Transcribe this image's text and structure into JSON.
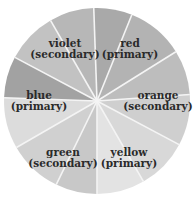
{
  "diagram": {
    "center": [
      97,
      101
    ],
    "radius": 93,
    "divider_color": "#f4f4f4",
    "segments": [
      {
        "start": -2,
        "end": 22,
        "fill": "#a9a9a9"
      },
      {
        "start": 22,
        "end": 58,
        "fill": "#b3b3b3"
      },
      {
        "start": 58,
        "end": 86,
        "fill": "#bdbdbd"
      },
      {
        "start": 86,
        "end": 118,
        "fill": "#cfcfcf"
      },
      {
        "start": 118,
        "end": 150,
        "fill": "#d8d8d8"
      },
      {
        "start": 150,
        "end": 180,
        "fill": "#e3e3e3"
      },
      {
        "start": 180,
        "end": 206,
        "fill": "#c8c8c8"
      },
      {
        "start": 206,
        "end": 240,
        "fill": "#d0d0d0"
      },
      {
        "start": 240,
        "end": 272,
        "fill": "#dcdcdc"
      },
      {
        "start": 272,
        "end": 298,
        "fill": "#a2a2a2"
      },
      {
        "start": 298,
        "end": 330,
        "fill": "#c2c2c2"
      },
      {
        "start": 330,
        "end": 358,
        "fill": "#b7b7b7"
      }
    ],
    "labels": [
      {
        "name": "violet",
        "type": "(secondary)",
        "x": 65,
        "y": 47
      },
      {
        "name": "red",
        "type": "(primary)",
        "x": 130,
        "y": 47
      },
      {
        "name": "orange",
        "type": "(secondary)",
        "x": 158,
        "y": 99
      },
      {
        "name": "blue",
        "type": "(primary)",
        "x": 39,
        "y": 99
      },
      {
        "name": "green",
        "type": "(secondary)",
        "x": 63,
        "y": 156
      },
      {
        "name": "yellow",
        "type": "(primary)",
        "x": 129,
        "y": 156
      }
    ]
  }
}
